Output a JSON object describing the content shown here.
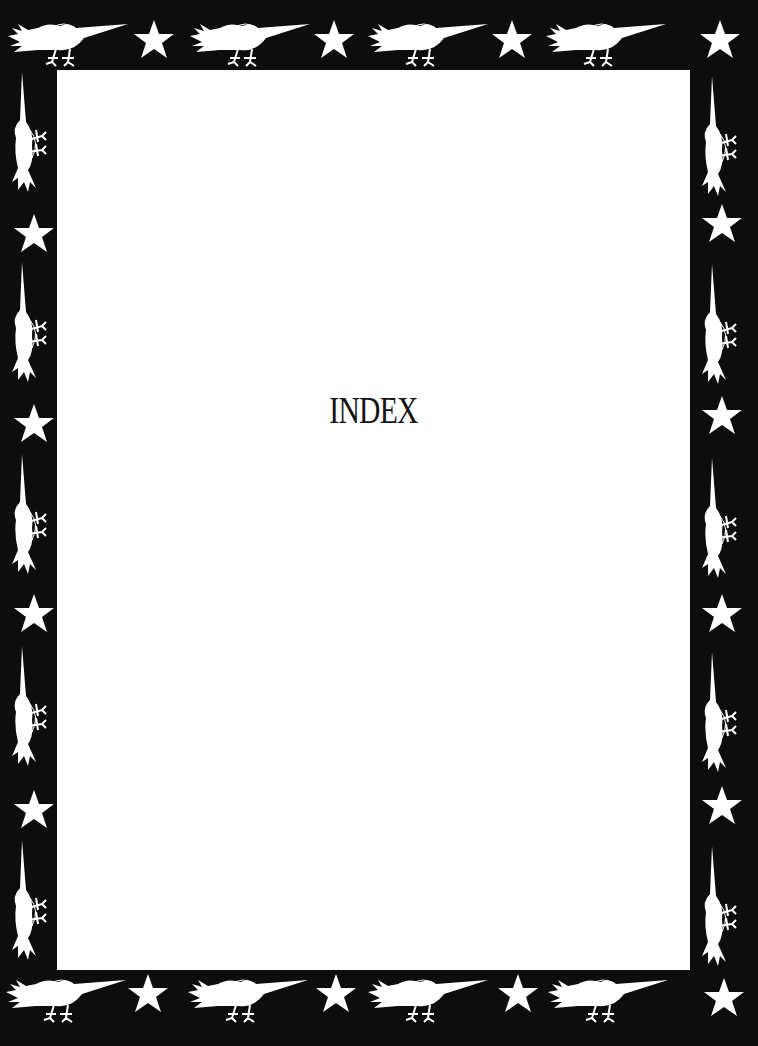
{
  "page": {
    "title": "INDEX"
  },
  "border": {
    "background": "#0d0d0d",
    "motif_color": "#ffffff",
    "motifs": [
      "bird-icon",
      "star-icon"
    ],
    "top_row": [
      "bird",
      "star",
      "bird",
      "star",
      "bird",
      "star",
      "bird",
      "star"
    ],
    "bottom_row": [
      "bird",
      "star",
      "bird",
      "star",
      "bird",
      "star",
      "bird",
      "star"
    ],
    "left_column": [
      "bird",
      "star",
      "bird",
      "star",
      "bird",
      "star",
      "bird",
      "star",
      "bird"
    ],
    "right_column": [
      "bird",
      "star",
      "bird",
      "star",
      "bird",
      "star",
      "bird",
      "star",
      "bird"
    ]
  }
}
